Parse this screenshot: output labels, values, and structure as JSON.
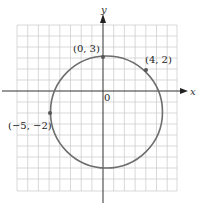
{
  "figure": {
    "x_axis_label": "x",
    "y_axis_label": "y",
    "origin_label": "0",
    "points": [
      {
        "label": "(0, 3)",
        "x": 0,
        "y": 3
      },
      {
        "label": "(4, 2)",
        "x": 4,
        "y": 2
      },
      {
        "label": "(−5, −2)",
        "x": -5,
        "y": -2
      }
    ],
    "colors": {
      "grid": "#c8c8c8",
      "axis": "#333333",
      "circle": "#6e6e6e",
      "point": "#555555"
    }
  }
}
